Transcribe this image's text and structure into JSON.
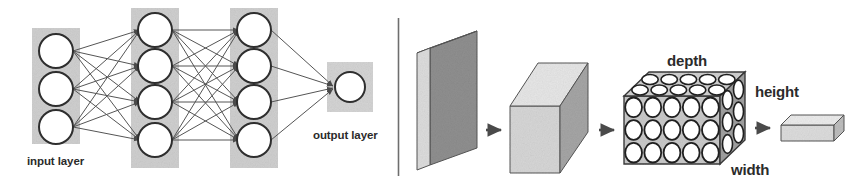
{
  "figure": {
    "background_color": "#ffffff",
    "divider": {
      "name": "panel-divider",
      "x": 398,
      "y1": 18,
      "y2": 176,
      "color": "#6e6e6e"
    }
  },
  "left_panel": {
    "name": "fully-connected-network-diagram",
    "labels": {
      "input": "input layer",
      "output": "output layer"
    },
    "layer_band_color": "#cfcfcf",
    "node_fill": "#ffffff",
    "node_stroke": "#2e2e2e",
    "edge_color": "#555555",
    "layers": [
      {
        "id": "input",
        "label": "input layer",
        "node_count": 3,
        "cx": 56,
        "band": {
          "x": 32,
          "y": 28,
          "w": 48,
          "h": 116
        },
        "cys": [
          51,
          89,
          127
        ],
        "r": 17
      },
      {
        "id": "hidden1",
        "label": "hidden layer 1",
        "node_count": 4,
        "cx": 155,
        "band": {
          "x": 131,
          "y": 8,
          "w": 48,
          "h": 160
        },
        "cys": [
          30,
          66,
          102,
          140
        ],
        "r": 17
      },
      {
        "id": "hidden2",
        "label": "hidden layer 2",
        "node_count": 4,
        "cx": 254,
        "band": {
          "x": 230,
          "y": 8,
          "w": 48,
          "h": 160
        },
        "cys": [
          30,
          66,
          102,
          140
        ],
        "r": 17
      },
      {
        "id": "output",
        "label": "output layer",
        "node_count": 1,
        "cx": 350,
        "band": {
          "x": 327,
          "y": 62,
          "w": 46,
          "h": 50
        },
        "cys": [
          87
        ],
        "r": 15
      }
    ]
  },
  "right_panel": {
    "name": "conv-volume-diagram",
    "labels": {
      "depth": "depth",
      "height": "height",
      "width": "width"
    },
    "shapes": [
      {
        "id": "input-slab",
        "name": "input-slab-shape",
        "kind": "thin-vertical-slab",
        "front_fill": "#8f8f8f",
        "top_fill": "#e8e8e8",
        "side_fill": "#d8d8d8"
      },
      {
        "id": "feature-cube",
        "name": "feature-cube-shape",
        "kind": "cube",
        "front_fill": "#d6d6d6",
        "top_fill": "#e2e2e2",
        "side_fill": "#a5a5a5"
      },
      {
        "id": "neuron-volume",
        "name": "neuron-volume-shape",
        "kind": "cube-with-neurons",
        "front_fill": "#c9c9c9",
        "top_fill": "#d0d0d0",
        "side_fill": "#a0a0a0",
        "neuron_cols": 5,
        "neuron_rows": 3,
        "neuron_fill": "#ffffff",
        "neuron_stroke": "#1f1f1f"
      },
      {
        "id": "output-bar",
        "name": "output-bar-shape",
        "kind": "flat-bar",
        "front_fill": "#dcdcdc",
        "top_fill": "#ebebeb",
        "side_fill": "#bdbdbd"
      }
    ],
    "arrows": [
      {
        "id": "arrow-1",
        "name": "flow-arrow-1",
        "x": 484,
        "y": 130
      },
      {
        "id": "arrow-2",
        "name": "flow-arrow-2",
        "x": 597,
        "y": 130
      },
      {
        "id": "arrow-3",
        "name": "flow-arrow-3",
        "x": 742,
        "y": 128
      }
    ],
    "arrow_color": "#4a4a4a"
  }
}
